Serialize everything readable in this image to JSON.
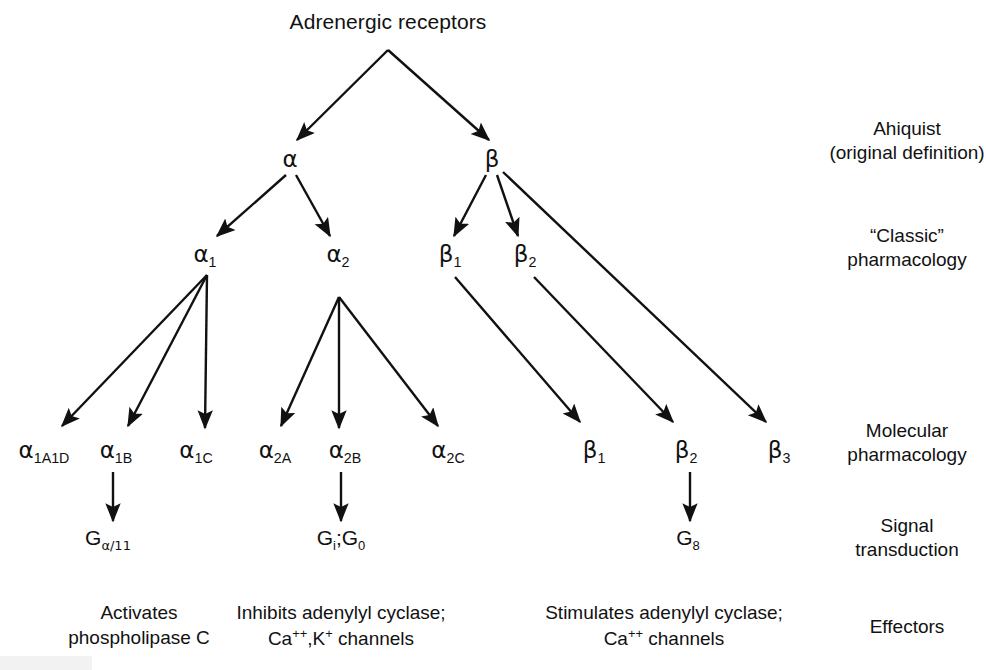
{
  "figure": {
    "root": {
      "label": "Adrenergic receptors"
    },
    "levels": [
      {
        "id": "ahlquist",
        "line1": "Ahiquist",
        "line2": "(original definition)"
      },
      {
        "id": "classic",
        "line1": "“Classic”",
        "line2": "pharmacology"
      },
      {
        "id": "molecular",
        "line1": "Molecular",
        "line2": "pharmacology"
      },
      {
        "id": "signal",
        "line1": "Signal",
        "line2": "transduction"
      },
      {
        "id": "effectors",
        "line1": "Effectors",
        "line2": ""
      }
    ],
    "original_nodes": [
      {
        "id": "alpha",
        "greek": "α",
        "sub": ""
      },
      {
        "id": "beta",
        "greek": "β",
        "sub": ""
      }
    ],
    "classic_nodes": [
      {
        "id": "alpha1",
        "greek": "α",
        "sub": "1"
      },
      {
        "id": "alpha2",
        "greek": "α",
        "sub": "2"
      },
      {
        "id": "beta1",
        "greek": "β",
        "sub": "1"
      },
      {
        "id": "beta2",
        "greek": "β",
        "sub": "2"
      }
    ],
    "molecular_nodes": [
      {
        "id": "alpha1A1D",
        "greek": "α",
        "sub": "1A1D"
      },
      {
        "id": "alpha1B",
        "greek": "α",
        "sub": "1B"
      },
      {
        "id": "alpha1C",
        "greek": "α",
        "sub": "1C"
      },
      {
        "id": "alpha2A",
        "greek": "α",
        "sub": "2A"
      },
      {
        "id": "alpha2B",
        "greek": "α",
        "sub": "2B"
      },
      {
        "id": "alpha2C",
        "greek": "α",
        "sub": "2C"
      },
      {
        "id": "beta1m",
        "greek": "β",
        "sub": "1"
      },
      {
        "id": "beta2m",
        "greek": "β",
        "sub": "2"
      },
      {
        "id": "beta3m",
        "greek": "β",
        "sub": "3"
      }
    ],
    "signal_nodes": [
      {
        "id": "gq11",
        "main": "G",
        "sub": "α/11",
        "sub_greek": true
      },
      {
        "id": "gigo",
        "main": "G",
        "sub": "i",
        "main2": ";G",
        "sub2": "0",
        "sub_greek": false
      },
      {
        "id": "gs",
        "main": "G",
        "sub": "8",
        "sub_greek": false
      }
    ],
    "effectors": [
      {
        "id": "alpha-effector",
        "line1": "Activates",
        "line2": "phospholipase C"
      },
      {
        "id": "alpha2-effector",
        "line1": "Inhibits adenylyl cyclase;",
        "line2_prefix": "Ca",
        "line2_sup1": "++",
        "line2_mid": ",K",
        "line2_sup2": "+",
        "line2_suffix": " channels"
      },
      {
        "id": "beta-effector",
        "line1": "Stimulates adenylyl cyclase;",
        "line2_prefix": "Ca",
        "line2_sup1": "++",
        "line2_mid": "",
        "line2_sup2": "",
        "line2_suffix": " channels"
      }
    ],
    "colors": {
      "ink": "#111111",
      "background": "#ffffff"
    }
  }
}
